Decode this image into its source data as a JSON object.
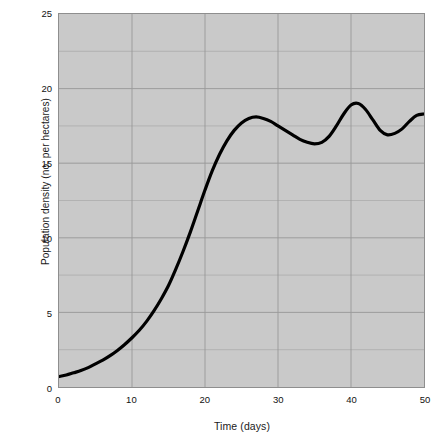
{
  "chart_data": {
    "type": "line",
    "title": "",
    "xlabel": "Time (days)",
    "ylabel": "Population density (no. per hectares)",
    "xlim": [
      0,
      50
    ],
    "ylim": [
      0,
      25
    ],
    "xticks": [
      0,
      10,
      20,
      30,
      40,
      50
    ],
    "yticks": [
      0,
      5,
      10,
      15,
      20,
      25
    ],
    "xtick_labels": [
      "0",
      "10",
      "20",
      "30",
      "40",
      "50"
    ],
    "ytick_labels": [
      "0",
      "5",
      "10",
      "15",
      "20",
      "25"
    ],
    "grid": true,
    "grid_minor_y_step": 2.5,
    "legend": "none",
    "plot_background": "#c9c9c9",
    "grid_color": "#9a9a9a",
    "line_color": "#000000",
    "line_width_px": 3.2,
    "series": [
      {
        "name": "Population density",
        "x": [
          0,
          1,
          2,
          3,
          4,
          5,
          6,
          7,
          8,
          9,
          10,
          11,
          12,
          13,
          14,
          15,
          16,
          17,
          18,
          19,
          20,
          21,
          22,
          23,
          24,
          25,
          26,
          27,
          28,
          29,
          30,
          31,
          32,
          33,
          34,
          35,
          36,
          37,
          38,
          39,
          40,
          41,
          42,
          43,
          44,
          45,
          46,
          47,
          48,
          49,
          50
        ],
        "y": [
          0.7,
          0.8,
          0.95,
          1.1,
          1.3,
          1.55,
          1.8,
          2.1,
          2.45,
          2.85,
          3.3,
          3.8,
          4.4,
          5.1,
          5.9,
          6.8,
          7.9,
          9.1,
          10.4,
          11.8,
          13.2,
          14.5,
          15.6,
          16.5,
          17.2,
          17.7,
          18.0,
          18.1,
          18.0,
          17.8,
          17.5,
          17.2,
          16.9,
          16.6,
          16.4,
          16.3,
          16.4,
          16.8,
          17.5,
          18.3,
          18.9,
          19.0,
          18.6,
          17.9,
          17.2,
          16.9,
          17.0,
          17.3,
          17.8,
          18.2,
          18.3
        ]
      }
    ]
  },
  "axes": {
    "y_title": "Population density (no. per hectares)",
    "x_title": "Time (days)"
  }
}
